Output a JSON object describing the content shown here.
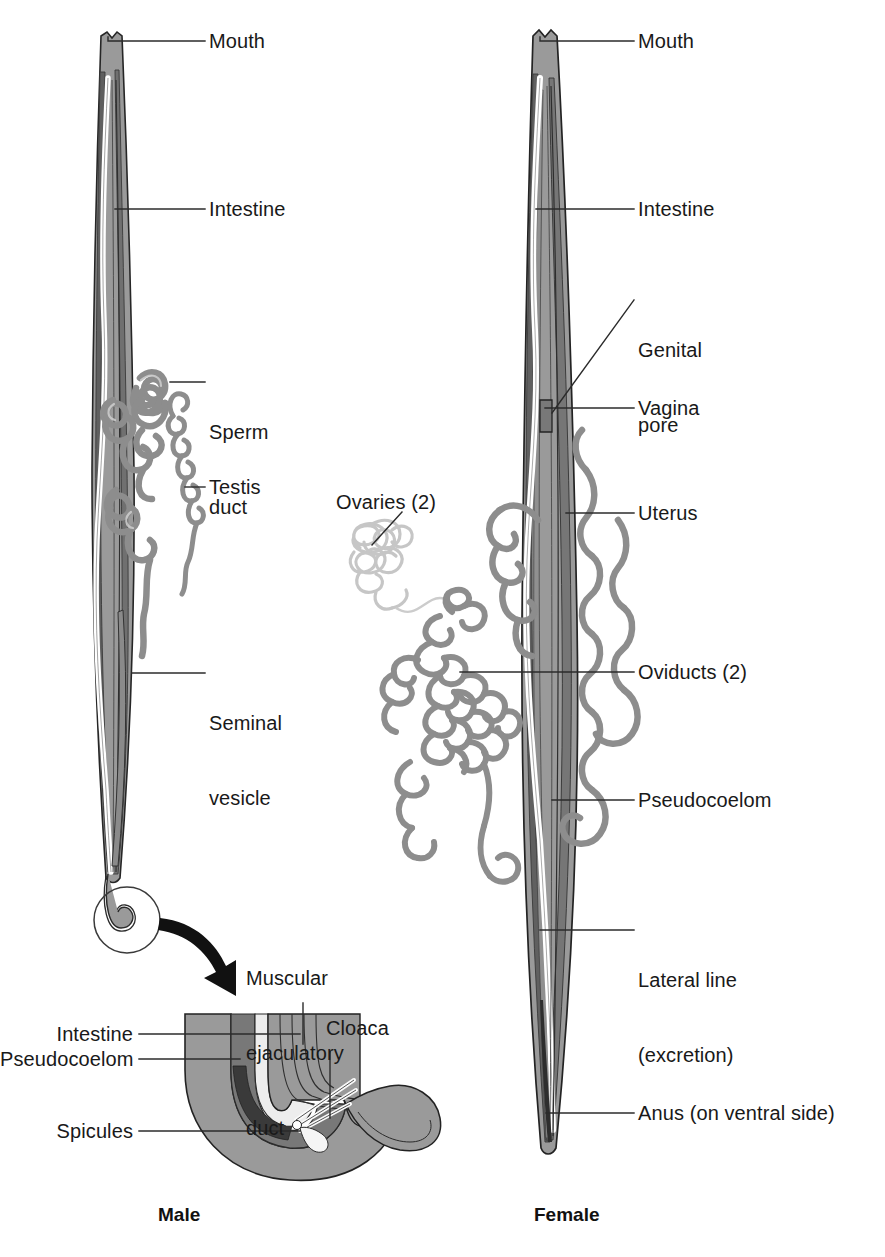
{
  "figure": {
    "captions": {
      "male": "Male",
      "female": "Female"
    },
    "colors": {
      "body_wall": "#9a9a9a",
      "body_wall_dark": "#6e6e6e",
      "pseudocoelom": "#8c8c8c",
      "intestine_light": "#efefef",
      "gonad_gray": "#8f8f8f",
      "ovary_light": "#cfcfcf",
      "outline": "#222222",
      "leader": "#2a2a2a",
      "background": "#ffffff"
    }
  },
  "male": {
    "labels": [
      {
        "id": "mouth",
        "text": "Mouth"
      },
      {
        "id": "intestine",
        "text": "Intestine"
      },
      {
        "id": "sperm-duct",
        "line1": "Sperm",
        "line2": "duct"
      },
      {
        "id": "testis",
        "text": "Testis"
      },
      {
        "id": "seminal-vesicle",
        "line1": "Seminal",
        "line2": "vesicle"
      }
    ]
  },
  "male_inset": {
    "labels": [
      {
        "id": "muscular-ejaculatory-duct",
        "line1": "Muscular",
        "line2": "ejaculatory",
        "line3": "duct"
      },
      {
        "id": "intestine",
        "text": "Intestine"
      },
      {
        "id": "pseudocoelom",
        "text": "Pseudocoelom"
      },
      {
        "id": "spicules",
        "text": "Spicules"
      },
      {
        "id": "cloaca",
        "text": "Cloaca"
      }
    ]
  },
  "female": {
    "labels": [
      {
        "id": "mouth",
        "text": "Mouth"
      },
      {
        "id": "intestine",
        "text": "Intestine"
      },
      {
        "id": "genital-pore",
        "line1": "Genital",
        "line2": "pore"
      },
      {
        "id": "vagina",
        "text": "Vagina"
      },
      {
        "id": "uterus",
        "text": "Uterus"
      },
      {
        "id": "ovaries",
        "text": "Ovaries (2)"
      },
      {
        "id": "oviducts",
        "text": "Oviducts (2)"
      },
      {
        "id": "pseudocoelom",
        "text": "Pseudocoelom"
      },
      {
        "id": "lateral-line",
        "line1": "Lateral line",
        "line2": "(excretion)"
      },
      {
        "id": "anus",
        "text": "Anus (on ventral side)"
      }
    ]
  }
}
